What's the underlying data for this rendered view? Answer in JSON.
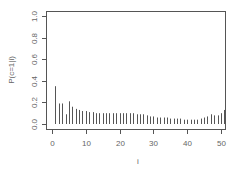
{
  "chart_data": {
    "type": "bar",
    "subtype": "histogram-lines",
    "title": "",
    "xlabel": "i",
    "ylabel": "P(c=1|i)",
    "xlim": [
      0,
      51
    ],
    "ylim": [
      0,
      1.0
    ],
    "xticks": [
      0,
      10,
      20,
      30,
      40,
      50
    ],
    "yticks": [
      0.0,
      0.2,
      0.4,
      0.6,
      0.8,
      1.0
    ],
    "xtick_labels": [
      "0",
      "10",
      "20",
      "30",
      "40",
      "50"
    ],
    "ytick_labels": [
      "0.0",
      "0.2",
      "0.4",
      "0.6",
      "0.8",
      "1.0"
    ],
    "grid": false,
    "legend": null,
    "x": [
      1,
      2,
      3,
      4,
      5,
      6,
      7,
      8,
      9,
      10,
      11,
      12,
      13,
      14,
      15,
      16,
      17,
      18,
      19,
      20,
      21,
      22,
      23,
      24,
      25,
      26,
      27,
      28,
      29,
      30,
      31,
      32,
      33,
      34,
      35,
      36,
      37,
      38,
      39,
      40,
      41,
      42,
      43,
      44,
      45,
      46,
      47,
      48,
      49,
      50,
      51
    ],
    "values": [
      0.35,
      0.19,
      0.19,
      0.09,
      0.21,
      0.16,
      0.14,
      0.13,
      0.12,
      0.12,
      0.11,
      0.11,
      0.1,
      0.1,
      0.1,
      0.1,
      0.1,
      0.1,
      0.1,
      0.1,
      0.1,
      0.1,
      0.1,
      0.1,
      0.09,
      0.09,
      0.09,
      0.08,
      0.07,
      0.07,
      0.06,
      0.06,
      0.06,
      0.06,
      0.05,
      0.05,
      0.05,
      0.05,
      0.04,
      0.04,
      0.04,
      0.04,
      0.04,
      0.05,
      0.06,
      0.07,
      0.09,
      0.08,
      0.08,
      0.1,
      0.13
    ]
  },
  "colors": {
    "bars": "#555555",
    "axis": "#555555",
    "frame": "#555555",
    "text": "#666666"
  }
}
